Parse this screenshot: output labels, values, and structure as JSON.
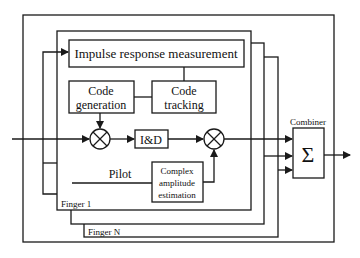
{
  "diagram": {
    "blocks": {
      "impulse": "Impulse response measurement",
      "code_gen_1": "Code",
      "code_gen_2": "generation",
      "code_track_1": "Code",
      "code_track_2": "tracking",
      "integrate_dump": "I&D",
      "complex_1": "Complex",
      "complex_2": "amplitude",
      "complex_3": "estimation",
      "combiner_label": "Combiner",
      "combiner_symbol": "Σ"
    },
    "labels": {
      "pilot": "Pilot",
      "finger_first": "Finger 1",
      "finger_last": "Finger N"
    },
    "colors": {
      "stroke": "#1a1a1a",
      "background": "#ffffff"
    }
  }
}
